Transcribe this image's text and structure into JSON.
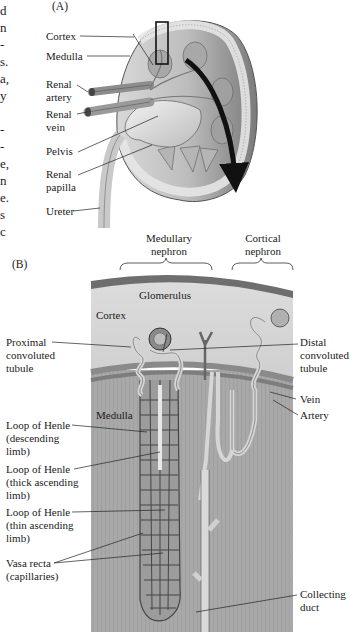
{
  "figure": {
    "panel_a": {
      "label": "(A)",
      "labels": {
        "cortex": "Cortex",
        "medulla": "Medulla",
        "renal_artery": "Renal\nartery",
        "renal_vein": "Renal\nvein",
        "pelvis": "Pelvis",
        "renal_papilla": "Renal\npapilla",
        "ureter": "Ureter"
      }
    },
    "panel_b": {
      "label": "(B)",
      "brackets": {
        "medullary": "Medullary\nnephron",
        "cortical": "Cortical\nnephron"
      },
      "labels": {
        "glomerulus": "Glomerulus",
        "cortex": "Cortex",
        "medulla": "Medulla",
        "proximal": "Proximal\nconvoluted\ntubule",
        "distal": "Distal\nconvoluted\ntubule",
        "vein": "Vein",
        "artery": "Artery",
        "loop_desc": "Loop of Henle\n(descending\nlimb)",
        "loop_thick": "Loop of Henle\n(thick ascending\nlimb)",
        "loop_thin": "Loop of Henle\n(thin ascending\nlimb)",
        "vasa_recta": "Vasa recta\n(capillaries)",
        "collecting_duct": "Collecting\nduct"
      }
    },
    "left_margin_fragments": [
      "d",
      "n",
      "-",
      "s.",
      "a,",
      "y",
      "",
      "-",
      "-",
      "e,",
      "n",
      "e.",
      "s",
      "c"
    ]
  }
}
